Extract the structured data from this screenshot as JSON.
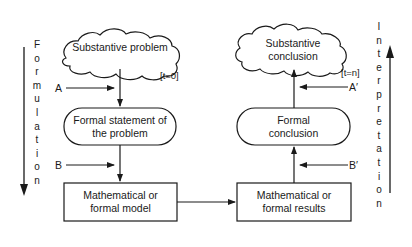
{
  "diagram": {
    "left_axis": {
      "label": "Formulation",
      "direction": "down"
    },
    "right_axis": {
      "label": "Interpretation",
      "direction": "up"
    },
    "nodes": {
      "substantive_problem": {
        "text": "Substantive problem",
        "shape": "cloud"
      },
      "formal_statement": {
        "text": "Formal statement of the problem",
        "line1": "Formal statement of",
        "line2": "the problem",
        "shape": "rounded"
      },
      "math_model": {
        "text": "Mathematical or formal model",
        "line1": "Mathematical or",
        "line2": "formal model",
        "shape": "rect"
      },
      "math_results": {
        "text": "Mathematical or formal results",
        "line1": "Mathematical or",
        "line2": "formal results",
        "shape": "rect"
      },
      "formal_conclusion": {
        "text": "Formal conclusion",
        "line1": "Formal",
        "line2": "conclusion",
        "shape": "rounded"
      },
      "substantive_conclusion": {
        "text": "Substantive conclusion",
        "line1": "Substantive",
        "line2": "conclusion",
        "shape": "cloud"
      }
    },
    "time_tags": {
      "start": "[t=0]",
      "end": "[t=n]"
    },
    "inputs": {
      "a": "A",
      "b": "B",
      "a_prime": "A′",
      "b_prime": "B′"
    },
    "edges": [
      [
        "substantive_problem",
        "formal_statement"
      ],
      [
        "formal_statement",
        "math_model"
      ],
      [
        "math_model",
        "math_results"
      ],
      [
        "math_results",
        "formal_conclusion"
      ],
      [
        "formal_conclusion",
        "substantive_conclusion"
      ]
    ]
  }
}
